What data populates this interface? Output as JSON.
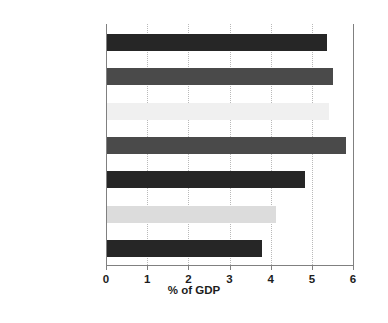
{
  "chart_data": {
    "type": "bar",
    "orientation": "horizontal",
    "title": "",
    "subtitle": "",
    "xlabel": "% of GDP",
    "ylabel": "",
    "categories": [
      "Canada",
      "France",
      "United States",
      "United Kingdom",
      "Germany",
      "Italy",
      "Japan"
    ],
    "values": [
      5.35,
      5.5,
      5.4,
      5.8,
      4.8,
      4.1,
      3.77
    ],
    "bar_colors": [
      "#262626",
      "#4a4a4a",
      "#f0f0f0",
      "#4a4a4a",
      "#262626",
      "#dcdcdc",
      "#262626"
    ],
    "xlim": [
      0,
      6
    ],
    "xticks": [
      0,
      1,
      2,
      3,
      4,
      5,
      6
    ],
    "xtick_labels": [
      "0",
      "1",
      "2",
      "3",
      "4",
      "5",
      "6"
    ],
    "grid": true,
    "grid_axis": "x",
    "grid_style": "dotted",
    "grid_color": "#b9b9b9",
    "legend": false,
    "legend_position": "none",
    "axis_color": "#808080",
    "text_color": "#1d1d1d",
    "background_color": "#ffffff"
  }
}
